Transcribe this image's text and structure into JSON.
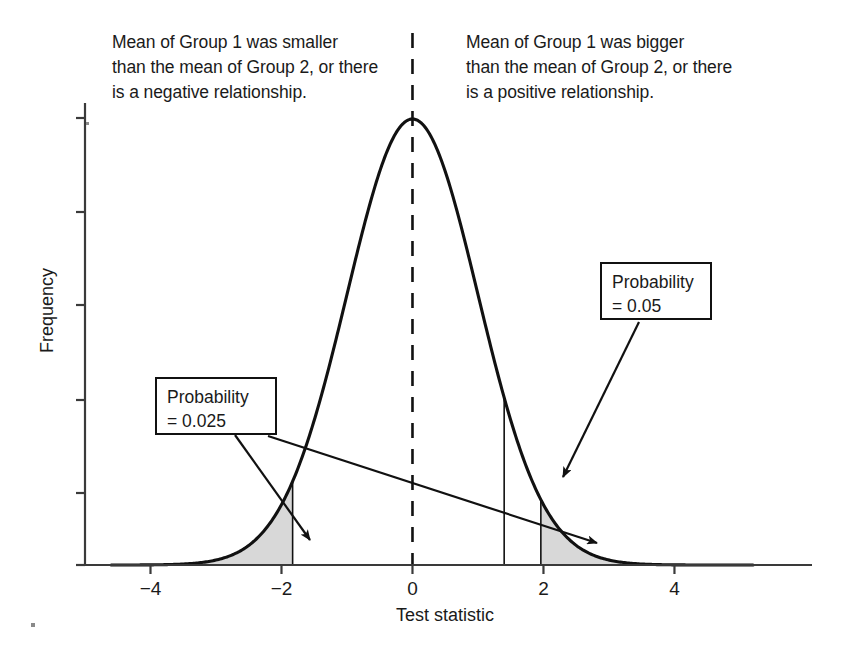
{
  "figure": {
    "background_color": "#ffffff",
    "line_color": "#111111",
    "shade_color": "#d8d8d8"
  },
  "annotations": {
    "left": "Mean of Group 1 was smaller\nthan the mean of Group 2, or there\nis a negative relationship.",
    "right": "Mean of Group 1 was bigger\nthan the mean of Group 2, or there\nis a positive relationship."
  },
  "callouts": [
    {
      "name": "probability-0025",
      "text": "Probability\n= 0.025",
      "label": "Probability",
      "value": "= 0.025"
    },
    {
      "name": "probability-005",
      "text": "Probability\n= 0.05",
      "label": "Probability",
      "value": "= 0.05"
    }
  ],
  "axes": {
    "x_title": "Test statistic",
    "y_title": "Frequency",
    "x_ticks": [
      "−4",
      "−2",
      "0",
      "2",
      "4"
    ],
    "x_tick_values": [
      -4,
      -2,
      0,
      2,
      4
    ],
    "y_ticks": [
      "",
      "",
      "",
      "",
      "",
      ""
    ]
  },
  "chart_data": {
    "type": "line",
    "title": "",
    "subtitle": "",
    "xlabel": "Test statistic",
    "ylabel": "Frequency",
    "xlim": [
      -5.0,
      6.1
    ],
    "ylim": [
      0,
      1.12
    ],
    "grid": false,
    "legend": null,
    "distribution": {
      "name": "standard normal",
      "mean": 0,
      "sd": 1,
      "peak_x": 0,
      "peak_y": 1.0
    },
    "x": [
      -4.0,
      -3.5,
      -3.0,
      -2.5,
      -2.0,
      -1.5,
      -1.0,
      -0.5,
      0.0,
      0.5,
      1.0,
      1.5,
      2.0,
      2.5,
      3.0,
      3.5,
      4.0
    ],
    "y": [
      0.0003,
      0.0022,
      0.0111,
      0.0439,
      0.1353,
      0.3247,
      0.6065,
      0.8825,
      1.0,
      0.8825,
      0.6065,
      0.3247,
      0.1353,
      0.0439,
      0.0111,
      0.0022,
      0.0003
    ],
    "series": [
      {
        "name": "normal density",
        "values": [
          0.0003,
          0.0022,
          0.0111,
          0.0439,
          0.1353,
          0.3247,
          0.6065,
          0.8825,
          1.0,
          0.8825,
          0.6065,
          0.3247,
          0.1353,
          0.0439,
          0.0111,
          0.0022,
          0.0003
        ]
      }
    ],
    "shaded_regions": [
      {
        "name": "left-tail-rejection-region",
        "from": -5.0,
        "to": -1.83,
        "area": 0.025,
        "color": "#d8d8d8"
      },
      {
        "name": "right-tail-rejection-region",
        "from": 1.96,
        "to": 6.1,
        "area": 0.025,
        "color": "#d8d8d8"
      }
    ],
    "vertical_lines": [
      {
        "name": "center-line",
        "x": 0,
        "style": "dashed"
      },
      {
        "name": "left-critical-boundary",
        "x": -1.83,
        "style": "solid"
      },
      {
        "name": "one-tailed-critical-boundary",
        "x": 1.4,
        "style": "solid"
      },
      {
        "name": "right-critical-boundary",
        "x": 1.96,
        "style": "solid"
      }
    ],
    "annotations": [
      {
        "text": "Probability = 0.025",
        "points_to": [
          -2.4,
          0.03
        ]
      },
      {
        "text": "Probability = 0.025",
        "points_to": [
          2.3,
          0.01
        ]
      },
      {
        "text": "Probability = 0.05",
        "points_to": [
          1.9,
          0.09
        ]
      }
    ]
  }
}
